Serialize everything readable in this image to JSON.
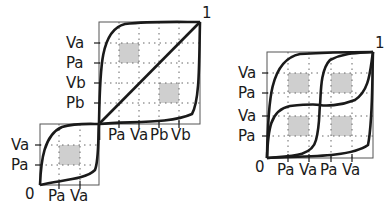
{
  "left_figure": {
    "corner_top": "1",
    "corner_bottom": "0",
    "large_box": {
      "y_labels": [
        "Va",
        "Pa",
        "Vb",
        "Pb"
      ],
      "x_labels": [
        "Pa",
        "Va",
        "Pb",
        "Vb"
      ]
    },
    "small_box": {
      "y_labels": [
        "Va",
        "Pa"
      ],
      "x_labels": [
        "Pa",
        "Va"
      ]
    }
  },
  "right_figure": {
    "corner_top": "1",
    "corner_bottom": "0",
    "y_labels": [
      "Va",
      "Pa",
      "Va",
      "Pa"
    ],
    "x_labels": [
      "Pa",
      "Va",
      "Pa",
      "Va"
    ]
  },
  "colors": {
    "stroke": "#1a1a1a",
    "frame": "#555555",
    "grid": "#666666",
    "shade": "#cfcfcf"
  }
}
